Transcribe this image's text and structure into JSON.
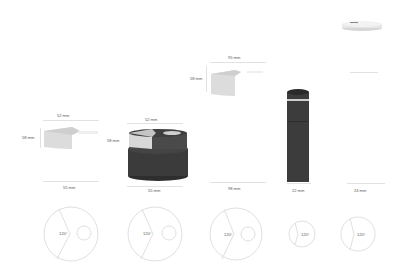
{
  "diagram": {
    "title": "",
    "colors": {
      "dark_body": "#3a3a3a",
      "light_cap": "#e4e4e4",
      "line": "#e0e0e0",
      "text": "#555555"
    },
    "products": [
      {
        "name": "product-1",
        "top_width": "52 mm",
        "height": "58 mm",
        "bottom_width": "55 mm",
        "angle": "120°"
      },
      {
        "name": "product-2",
        "top_width": "52 mm",
        "height": "58 mm",
        "bottom_width": "55 mm",
        "angle": "120°"
      },
      {
        "name": "product-3",
        "top_width": "95 mm",
        "height": "58 mm",
        "bottom_width": "98 mm",
        "angle": "120°"
      },
      {
        "name": "product-4",
        "bottom_width": "22 mm",
        "angle": "120°"
      },
      {
        "name": "product-5",
        "bottom_width": "24 mm",
        "angle": "120°"
      }
    ]
  }
}
